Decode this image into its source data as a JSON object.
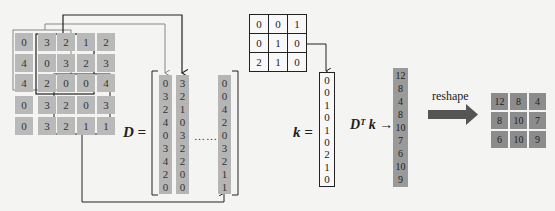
{
  "input_matrix": {
    "rows": [
      [
        0,
        3,
        2,
        1,
        2
      ],
      [
        4,
        0,
        3,
        2,
        3
      ],
      [
        4,
        2,
        0,
        0,
        4
      ],
      [
        0,
        3,
        2,
        0,
        3
      ],
      [
        0,
        3,
        2,
        1,
        1
      ]
    ]
  },
  "D_matrix": {
    "label": "D =",
    "columns": [
      [
        0,
        3,
        2,
        4,
        0,
        3,
        4,
        2,
        0
      ],
      [
        3,
        2,
        1,
        0,
        3,
        2,
        2,
        0,
        0
      ]
    ],
    "ellipsis": "……",
    "last_column": [
      0,
      0,
      4,
      2,
      0,
      3,
      2,
      1,
      1
    ]
  },
  "kernel": {
    "rows": [
      [
        0,
        0,
        1
      ],
      [
        0,
        1,
        0
      ],
      [
        2,
        1,
        0
      ]
    ]
  },
  "k_vector": {
    "label": "k =",
    "values": [
      0,
      0,
      1,
      0,
      1,
      0,
      2,
      1,
      0
    ]
  },
  "result": {
    "label": "Dᵀ k →",
    "values": [
      12,
      8,
      4,
      8,
      10,
      7,
      6,
      10,
      9
    ]
  },
  "reshape": {
    "label": "reshape"
  },
  "output_matrix": {
    "rows": [
      [
        12,
        8,
        4
      ],
      [
        8,
        10,
        7
      ],
      [
        6,
        10,
        9
      ]
    ]
  },
  "colors": {
    "cell_light": "#b9b9b9",
    "cell_dark": "#8c8c8c",
    "arrow_dark": "#222222",
    "arrow_grey": "#8a8a8a"
  }
}
